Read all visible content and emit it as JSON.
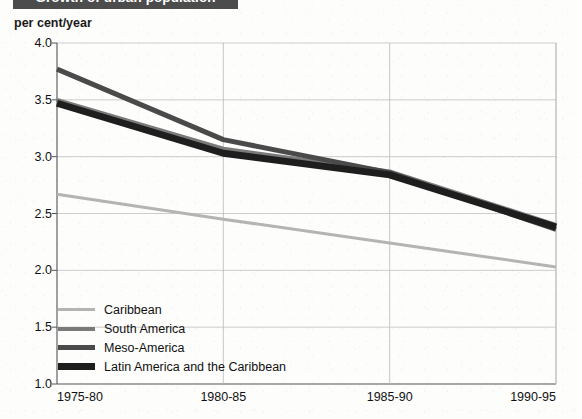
{
  "title": "Growth of urban population",
  "unit_label": "per cent/year",
  "legend": {
    "items": [
      {
        "label": "Caribbean",
        "color": "#b4b4b4",
        "thickness": 3
      },
      {
        "label": "South America",
        "color": "#7a7a7a",
        "thickness": 4
      },
      {
        "label": "Meso-America",
        "color": "#4a4a4a",
        "thickness": 5
      },
      {
        "label": "Latin America and the Caribbean",
        "color": "#1e1e1e",
        "thickness": 7
      }
    ]
  },
  "chart_data": {
    "type": "line",
    "title": "Growth of urban population",
    "xlabel": "",
    "ylabel": "per cent/year",
    "ylim": [
      1.0,
      4.0
    ],
    "yticks": [
      "1.0",
      "1.5",
      "2.0",
      "2.5",
      "3.0",
      "3.5",
      "4.0"
    ],
    "ytick_values": [
      1.0,
      1.5,
      2.0,
      2.5,
      3.0,
      3.5,
      4.0
    ],
    "categories": [
      "1975-80",
      "1980-85",
      "1985-90",
      "1990-95"
    ],
    "grid": true,
    "legend_position": "inside-bottom-left",
    "series": [
      {
        "name": "Caribbean",
        "color": "#b4b4b4",
        "thickness": 3,
        "values": [
          2.67,
          2.45,
          2.24,
          2.03
        ]
      },
      {
        "name": "South America",
        "color": "#7a7a7a",
        "thickness": 4,
        "values": [
          3.5,
          3.07,
          2.87,
          2.4
        ]
      },
      {
        "name": "Meso-America",
        "color": "#4a4a4a",
        "thickness": 5,
        "values": [
          3.77,
          3.15,
          2.86,
          2.36
        ]
      },
      {
        "name": "Latin America and the Caribbean",
        "color": "#1e1e1e",
        "thickness": 7,
        "values": [
          3.47,
          3.03,
          2.84,
          2.38
        ]
      }
    ]
  },
  "geometry": {
    "plot_left": 57,
    "plot_right": 556,
    "plot_top": 43,
    "plot_bottom": 384
  }
}
